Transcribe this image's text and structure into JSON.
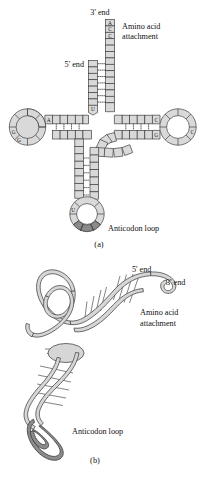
{
  "figure": {
    "title_visible": false,
    "panels": [
      {
        "id": "a",
        "caption": "(a)",
        "description": "tRNA cloverleaf secondary structure",
        "labels": {
          "three_prime": "3' end",
          "five_prime": "5' end",
          "amino_acid_line1": "Amino acid",
          "amino_acid_line2": "attachment",
          "anticodon": "Anticodon loop"
        },
        "acceptor_tail_bases": [
          "A",
          "C",
          "C"
        ],
        "annotated_bases": [
          {
            "letter": "U",
            "region": "acceptor-stem-5prime-base"
          },
          {
            "letter": "A",
            "region": "d-loop-stem-junction"
          },
          {
            "letter": "G",
            "region": "d-loop-left-upper"
          },
          {
            "letter": "G",
            "region": "d-loop-left-lower"
          },
          {
            "letter": "C",
            "region": "t-loop-upper-left"
          },
          {
            "letter": "G",
            "region": "t-loop-lower-left"
          },
          {
            "letter": "C",
            "region": "t-loop-right"
          },
          {
            "letter": "U",
            "region": "anticodon-loop-left"
          }
        ],
        "anticodon_segment_count": 3,
        "colors": {
          "base_fill": "#d9d9d9",
          "base_stroke": "#3a3a3a",
          "anticodon_fill": "#8a8a8a",
          "hbond": "#2a2a2a"
        }
      },
      {
        "id": "b",
        "caption": "(b)",
        "description": "tRNA tertiary L-shaped folded structure",
        "labels": {
          "five_prime": "5' end",
          "three_prime": "3' end",
          "amino_acid_line1": "Amino acid",
          "amino_acid_line2": "attachment",
          "anticodon": "Anticodon loop"
        },
        "colors": {
          "ribbon_fill": "#d6d6d6",
          "ribbon_stroke": "#4a4a4a",
          "anticodon_ribbon": "#8c8c8c",
          "rung_fill": "#bfbfbf"
        }
      }
    ]
  }
}
